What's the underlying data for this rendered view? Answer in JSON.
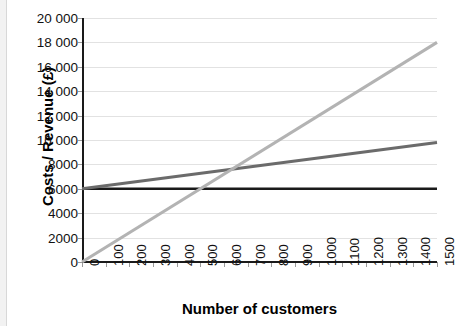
{
  "chart_data": {
    "type": "line",
    "title": "",
    "xlabel": "Number of customers",
    "ylabel": "Costs / Revenue (£)",
    "xlim": [
      0,
      1500
    ],
    "ylim": [
      0,
      20000
    ],
    "grid": true,
    "legend": "none",
    "x": [
      0,
      1500
    ],
    "x_tick_labels": [
      "0",
      "100",
      "200",
      "300",
      "400",
      "500",
      "600",
      "700",
      "800",
      "900",
      "1000",
      "1100",
      "1200",
      "1300",
      "1400",
      "1500"
    ],
    "x_tick_values": [
      0,
      100,
      200,
      300,
      400,
      500,
      600,
      700,
      800,
      900,
      1000,
      1100,
      1200,
      1300,
      1400,
      1500
    ],
    "y_tick_labels": [
      "0",
      "2000",
      "4000",
      "6000",
      "8000",
      "10 000",
      "12 000",
      "14 000",
      "16 000",
      "18 000",
      "20 000"
    ],
    "y_tick_values": [
      0,
      2000,
      4000,
      6000,
      8000,
      10000,
      12000,
      14000,
      16000,
      18000,
      20000
    ],
    "series": [
      {
        "name": "fixed-costs",
        "color": "#1a1a1a",
        "width": 2.6,
        "points": [
          [
            0,
            6000
          ],
          [
            1500,
            6000
          ]
        ]
      },
      {
        "name": "total-costs",
        "color": "#6b6b6b",
        "width": 3.0,
        "points": [
          [
            0,
            6000
          ],
          [
            1500,
            9800
          ]
        ]
      },
      {
        "name": "revenue",
        "color": "#b3b3b3",
        "width": 3.0,
        "points": [
          [
            0,
            0
          ],
          [
            1500,
            18000
          ]
        ]
      }
    ],
    "intersections": [
      {
        "name": "break-even",
        "x": 620,
        "y": 7570
      }
    ]
  }
}
